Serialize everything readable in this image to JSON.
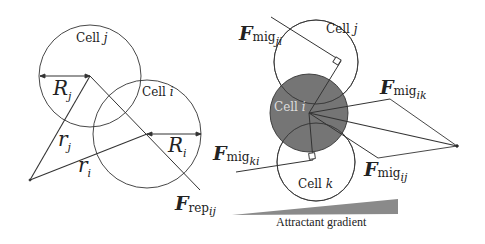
{
  "left_panel": {
    "cell_j_label": "Cell",
    "cell_j_var": "j",
    "cell_i_label": "Cell",
    "cell_i_var": "i",
    "radius_j": "R",
    "radius_j_sub": "j",
    "radius_i": "R",
    "radius_i_sub": "i",
    "position_j": "r",
    "position_j_sub": "j",
    "position_i": "r",
    "position_i_sub": "i",
    "force_rep": "F",
    "force_rep_sub": "rep",
    "force_rep_idx": "ij"
  },
  "right_panel": {
    "cell_j_label": "Cell",
    "cell_j_var": "j",
    "cell_i_label": "Cell",
    "cell_i_var": "i",
    "cell_k_label": "Cell",
    "cell_k_var": "k",
    "force_ji": {
      "F": "F",
      "sub": "mig",
      "idx": "ji"
    },
    "force_ik": {
      "F": "F",
      "sub": "mig",
      "idx": "ik"
    },
    "force_ki": {
      "F": "F",
      "sub": "mig",
      "idx": "ki"
    },
    "force_ij": {
      "F": "F",
      "sub": "mig",
      "idx": "ij"
    },
    "gradient_label": "Attractant gradient",
    "cell_i_fill": "#666666"
  }
}
